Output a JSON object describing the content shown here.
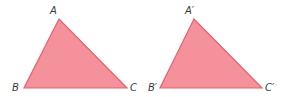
{
  "diagram": {
    "fill_color": "#f4919a",
    "stroke_color": "#e2626f",
    "label_color": "#3a3a3a",
    "triangles": [
      {
        "name": "triangle-abc",
        "vertices": [
          {
            "label": "A",
            "x": 59,
            "y": 19,
            "lx": 50,
            "ly": 14
          },
          {
            "label": "B",
            "x": 24,
            "y": 88,
            "lx": 12,
            "ly": 91
          },
          {
            "label": "C",
            "x": 127,
            "y": 88,
            "lx": 130,
            "ly": 91
          }
        ]
      },
      {
        "name": "triangle-abc-prime",
        "vertices": [
          {
            "label": "A′",
            "x": 194,
            "y": 19,
            "lx": 185,
            "ly": 14
          },
          {
            "label": "B′",
            "x": 160,
            "y": 88,
            "lx": 148,
            "ly": 91
          },
          {
            "label": "C′",
            "x": 262,
            "y": 88,
            "lx": 265,
            "ly": 91
          }
        ]
      }
    ]
  }
}
